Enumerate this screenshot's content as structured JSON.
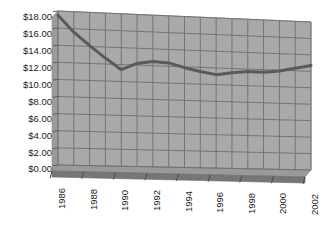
{
  "chart_data": {
    "type": "line",
    "title": "",
    "subtitle": "",
    "xlabel": "",
    "ylabel": "",
    "grid": true,
    "legend": "none",
    "style": "3d-perspective-line",
    "xlim": [
      1986,
      2002
    ],
    "ylim": [
      0,
      18
    ],
    "ytick_step": 2,
    "x_tick_labels": [
      "1986",
      "1988",
      "1990",
      "1992",
      "1994",
      "1996",
      "1998",
      "2000",
      "2002"
    ],
    "y_tick_labels": [
      "$18.00",
      "$16.00",
      "$14.00",
      "$12.00",
      "$10.00",
      "$8.00",
      "$6.00",
      "$4.00",
      "$2.00",
      "$0.00"
    ],
    "x": [
      1986,
      1987,
      1988,
      1989,
      1990,
      1991,
      1992,
      1993,
      1994,
      1995,
      1996,
      1997,
      1998,
      1999,
      2000,
      2001,
      2002
    ],
    "series": [
      {
        "name": "value",
        "color": "#5a5a5a",
        "values": [
          17.5,
          15.6,
          14.1,
          12.7,
          11.4,
          12.2,
          12.5,
          12.4,
          11.9,
          11.5,
          11.2,
          11.5,
          11.7,
          11.7,
          11.9,
          12.3,
          12.7
        ]
      }
    ]
  },
  "colors": {
    "plot_fill": "#a9a9a9",
    "gridline": "#6e6e6e",
    "floor": "#767676",
    "floor_top": "#9a9a9a",
    "line": "#5a5a5a",
    "axis_text": "#1a1a1a",
    "background": "#ffffff"
  },
  "yaxis": {
    "labels": [
      "$18.00",
      "$16.00",
      "$14.00",
      "$12.00",
      "$10.00",
      "$8.00",
      "$6.00",
      "$4.00",
      "$2.00",
      "$0.00"
    ]
  },
  "xaxis": {
    "labels": [
      "1986",
      "1988",
      "1990",
      "1992",
      "1994",
      "1996",
      "1998",
      "2000",
      "2002"
    ]
  }
}
